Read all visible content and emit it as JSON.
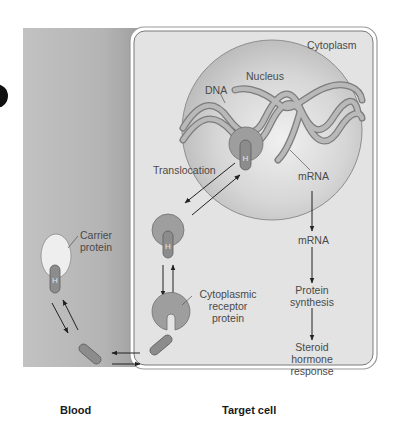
{
  "figure": {
    "regions": {
      "blood": "Blood",
      "target_cell": "Target cell"
    },
    "labels": {
      "cytoplasm": "Cytoplasm",
      "nucleus": "Nucleus",
      "dna": "DNA",
      "translocation": "Translocation",
      "mrna_nuclear": "mRNA",
      "mrna_cytoplasm": "mRNA",
      "carrier_protein_line1": "Carrier",
      "carrier_protein_line2": "protein",
      "cytoplasmic_receptor_line1": "Cytoplasmic",
      "cytoplasmic_receptor_line2": "receptor",
      "cytoplasmic_receptor_line3": "protein",
      "protein_synthesis_line1": "Protein",
      "protein_synthesis_line2": "synthesis",
      "steroid_response_line1": "Steroid",
      "steroid_response_line2": "hormone",
      "steroid_response_line3": "response"
    },
    "hormone_glyph": "H",
    "colors": {
      "blood_bg_dark": "#a8a8a8",
      "blood_bg_light": "#c4c4c4",
      "cell_bg": "#e2e2e2",
      "cell_border": "#8a8a8a",
      "nucleus_fill": "#cfcfcf",
      "receptor_fill": "#9e9e9e",
      "carrier_fill": "#ececec",
      "hormone_fill": "#8e8e8e",
      "dna_fill": "#b0b0b0",
      "arrow": "#222222",
      "text": "#4a4a4a"
    },
    "pathway": [
      "Carrier protein releases hormone in blood",
      "Hormone diffuses into target cell",
      "Binds cytoplasmic receptor protein",
      "Translocation into nucleus",
      "mRNA",
      "Protein synthesis",
      "Steroid hormone response"
    ]
  }
}
